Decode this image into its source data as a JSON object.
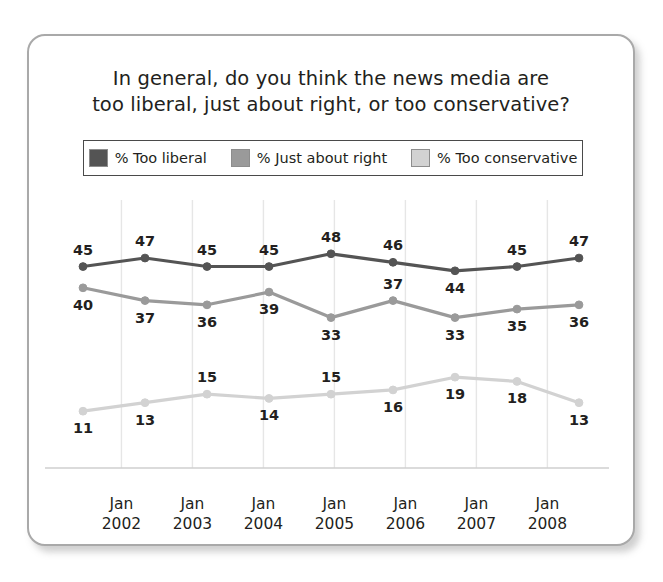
{
  "card": {
    "title_line1": "In general, do you think the news media are",
    "title_line2": "too liberal, just about right, or too conservative?"
  },
  "legend": {
    "items": [
      {
        "label": "% Too liberal",
        "color": "#545454",
        "swatch_name": "legend-swatch-too-liberal"
      },
      {
        "label": "% Just about right",
        "color": "#9a9a9a",
        "swatch_name": "legend-swatch-just-about-right"
      },
      {
        "label": "% Too conservative",
        "color": "#d2d2d2",
        "swatch_name": "legend-swatch-too-conservative"
      }
    ]
  },
  "axis": {
    "ticks": [
      {
        "month": "Jan",
        "year": "2002"
      },
      {
        "month": "Jan",
        "year": "2003"
      },
      {
        "month": "Jan",
        "year": "2004"
      },
      {
        "month": "Jan",
        "year": "2005"
      },
      {
        "month": "Jan",
        "year": "2006"
      },
      {
        "month": "Jan",
        "year": "2007"
      },
      {
        "month": "Jan",
        "year": "2008"
      }
    ]
  },
  "chart_data": {
    "type": "line",
    "title": "In general, do you think the news media are too liberal, just about right, or too conservative?",
    "xlabel": "",
    "ylabel": "",
    "ylim": [
      0,
      55
    ],
    "grid": "vertical",
    "legend_position": "top",
    "categories": [
      "1",
      "2",
      "3",
      "4",
      "5",
      "6",
      "7",
      "8",
      "9"
    ],
    "tick_labels": [
      "Jan 2002",
      "Jan 2003",
      "Jan 2004",
      "Jan 2005",
      "Jan 2006",
      "Jan 2007",
      "Jan 2008"
    ],
    "series": [
      {
        "name": "% Too liberal",
        "color": "#545454",
        "values": [
          45,
          47,
          45,
          45,
          48,
          46,
          44,
          45,
          47
        ],
        "label_positions": [
          "above",
          "above",
          "above",
          "above",
          "above",
          "above",
          "below",
          "above",
          "above"
        ]
      },
      {
        "name": "% Just about right",
        "color": "#9a9a9a",
        "values": [
          40,
          37,
          36,
          39,
          33,
          37,
          33,
          35,
          36
        ],
        "label_positions": [
          "below",
          "below",
          "below",
          "below",
          "below",
          "above",
          "below",
          "below",
          "below"
        ]
      },
      {
        "name": "% Too conservative",
        "color": "#d2d2d2",
        "values": [
          11,
          13,
          15,
          14,
          15,
          16,
          19,
          18,
          13
        ],
        "label_positions": [
          "below",
          "below",
          "above",
          "below",
          "above",
          "below",
          "below",
          "below",
          "below"
        ]
      }
    ]
  }
}
